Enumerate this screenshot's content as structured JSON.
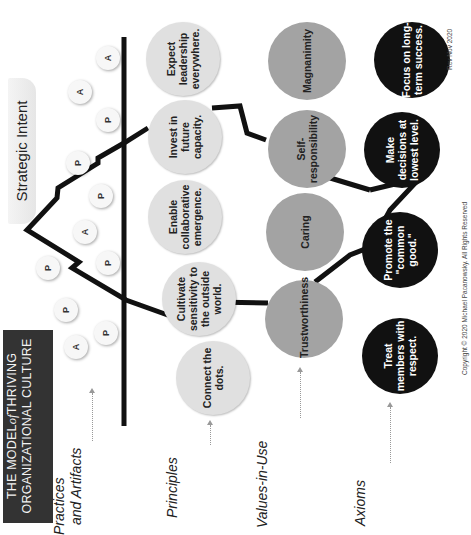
{
  "title": {
    "line1_pre": "THE MODEL",
    "line1_of": "of",
    "line1_post": "THRIVING",
    "line2": "ORGANIZATIONAL CULTURE"
  },
  "strategic_intent": "Strategic Intent",
  "row_labels": {
    "practices": "Practices",
    "practices_2": "and Artifacts",
    "principles": "Principles",
    "values": "Values-in-Use",
    "axioms": "Axioms"
  },
  "practice_markers": [
    {
      "label": "A",
      "x": 108,
      "y": 58
    },
    {
      "label": "A",
      "x": 80,
      "y": 92
    },
    {
      "label": "P",
      "x": 108,
      "y": 120
    },
    {
      "label": "P",
      "x": 78,
      "y": 163
    },
    {
      "label": "P",
      "x": 101,
      "y": 196
    },
    {
      "label": "A",
      "x": 85,
      "y": 232
    },
    {
      "label": "P",
      "x": 108,
      "y": 263
    },
    {
      "label": "P",
      "x": 48,
      "y": 268
    },
    {
      "label": "P",
      "x": 66,
      "y": 310
    },
    {
      "label": "A",
      "x": 76,
      "y": 347
    },
    {
      "label": "P",
      "x": 106,
      "y": 333
    }
  ],
  "principles": [
    "Expect\nleadership\neverywhere.",
    "Invest in\nfuture\ncapacity.",
    "Enable\ncollaborative\nemergence.",
    "Cultivate\nsensitivity to\nthe outside\nworld.",
    "Connect the\ndots."
  ],
  "values": [
    "Magnanimity",
    "Self-\nresponsibility",
    "Caring",
    "Trustworthiness"
  ],
  "axioms": [
    "Focus on long-\nterm success.",
    "Make\ndecisions at\nlowest level.",
    "Promote the\n\"common good.\"",
    "Treat\nmembers with\nrespect."
  ],
  "footer": {
    "copyright": "Copyright © 2020 Michael Pacanowsky. All Rights Reserved",
    "revision": "Rev Nov 2020"
  },
  "colors": {
    "title_bg": "#333333",
    "principle_fill": "#e0e0e0",
    "value_fill": "#a3a3a3",
    "axiom_fill": "#111111",
    "line": "#111111"
  }
}
